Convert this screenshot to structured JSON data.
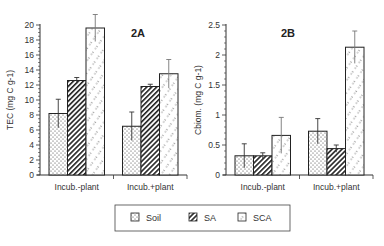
{
  "legend": {
    "items": [
      {
        "label": "Soil",
        "pattern": "dots"
      },
      {
        "label": "SA",
        "pattern": "hatch"
      },
      {
        "label": "SCA",
        "pattern": "dots-diag"
      }
    ]
  },
  "chart_data": [
    {
      "type": "bar",
      "title": "2A",
      "xlabel": "",
      "ylabel": "TEC (mg C g-1)",
      "categories": [
        "Incub.-plant",
        "Incub.+plant"
      ],
      "ylim": [
        0,
        20
      ],
      "yticks": [
        0,
        2,
        4,
        6,
        8,
        10,
        12,
        14,
        16,
        18,
        20
      ],
      "grid": false,
      "legend_position": "bottom-center",
      "series": [
        {
          "name": "Soil",
          "values": [
            8.2,
            6.5
          ],
          "errors": [
            1.9,
            1.9
          ]
        },
        {
          "name": "SA",
          "values": [
            12.6,
            11.8
          ],
          "errors": [
            0.4,
            0.3
          ]
        },
        {
          "name": "SCA",
          "values": [
            19.6,
            13.5
          ],
          "errors": [
            1.8,
            1.9
          ]
        }
      ]
    },
    {
      "type": "bar",
      "title": "2B",
      "xlabel": "",
      "ylabel": "Cbiom. (mg C g-1)",
      "categories": [
        "Incub.-plant",
        "Incub.+plant"
      ],
      "ylim": [
        0,
        2.5
      ],
      "yticks": [
        0,
        0.5,
        1,
        1.5,
        2,
        2.5
      ],
      "ytick_labels": [
        "0",
        "0.5",
        "1",
        "1.5",
        "2",
        "2.5"
      ],
      "grid": false,
      "legend_position": "bottom-center",
      "series": [
        {
          "name": "Soil",
          "values": [
            0.32,
            0.73
          ],
          "errors": [
            0.2,
            0.21
          ]
        },
        {
          "name": "SA",
          "values": [
            0.32,
            0.44
          ],
          "errors": [
            0.05,
            0.06
          ]
        },
        {
          "name": "SCA",
          "values": [
            0.66,
            2.13
          ],
          "errors": [
            0.3,
            0.27
          ]
        }
      ]
    }
  ]
}
